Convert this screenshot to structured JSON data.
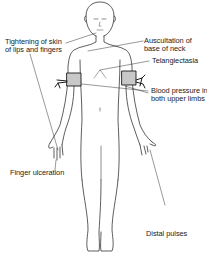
{
  "figure": {
    "line_color": "#1a1a1a",
    "cuff_fill": "#c8c8c8"
  },
  "labels": {
    "lips_fingers_1": "Tightening of skin",
    "lips_fingers_2": "of lips and fingers",
    "auscultation_1": "Auscultation of",
    "auscultation_2": "base of neck",
    "telangiectasia": "Telangiectasia",
    "bp_1": "Blood pressure in",
    "bp_2": "both upper limbs",
    "finger_ulceration": "Finger ulceration",
    "distal_pulses": "Distal pulses"
  }
}
